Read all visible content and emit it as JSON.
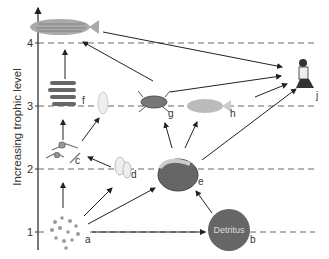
{
  "diagram": {
    "type": "food-web",
    "y_axis_label": "Increasing trophic level",
    "levels": [
      {
        "value": "1",
        "y": 232
      },
      {
        "value": "2",
        "y": 169
      },
      {
        "value": "3",
        "y": 106
      },
      {
        "value": "4",
        "y": 43
      }
    ],
    "nodes": [
      {
        "id": "a",
        "label": "a",
        "description": "phytoplankton"
      },
      {
        "id": "b",
        "label": "b",
        "description": "Detritus",
        "text": "Detritus"
      },
      {
        "id": "c",
        "label": "c",
        "description": "zooplankton"
      },
      {
        "id": "d",
        "label": "d",
        "description": "bivalve larvae"
      },
      {
        "id": "e",
        "label": "e",
        "description": "clam"
      },
      {
        "id": "f",
        "label": "f",
        "description": "small fish (anchovy school)"
      },
      {
        "id": "g",
        "label": "g",
        "description": "blue crab"
      },
      {
        "id": "h",
        "label": "h",
        "description": "fish (croaker)"
      },
      {
        "id": "i",
        "label": "",
        "description": "jellyfish"
      },
      {
        "id": "j",
        "label": "j",
        "description": "human fisher"
      },
      {
        "id": "k",
        "label": "",
        "description": "striped bass"
      }
    ],
    "edges": [
      [
        "a",
        "c"
      ],
      [
        "a",
        "d"
      ],
      [
        "a",
        "e"
      ],
      [
        "a",
        "b"
      ],
      [
        "b",
        "e"
      ],
      [
        "d",
        "c"
      ],
      [
        "c",
        "f"
      ],
      [
        "c",
        "i"
      ],
      [
        "f",
        "k"
      ],
      [
        "e",
        "g"
      ],
      [
        "e",
        "h"
      ],
      [
        "e",
        "j"
      ],
      [
        "g",
        "k"
      ],
      [
        "g",
        "j"
      ],
      [
        "h",
        "j"
      ],
      [
        "k",
        "j"
      ]
    ]
  }
}
